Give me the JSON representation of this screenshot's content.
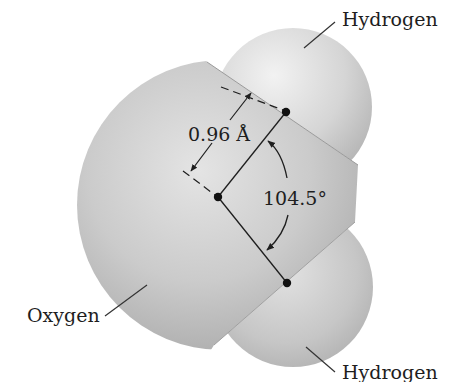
{
  "diagram": {
    "atoms": [
      {
        "id": "hydrogen-top",
        "label": "Hydrogen"
      },
      {
        "id": "oxygen",
        "label": "Oxygen"
      },
      {
        "id": "hydrogen-bottom",
        "label": "Hydrogen"
      }
    ],
    "bond_length": {
      "value": "0.96",
      "unit": "Å",
      "text": "0.96 Å"
    },
    "bond_angle": {
      "value": "104.5",
      "unit": "°",
      "text": "104.5°"
    },
    "colors": {
      "background": "#ffffff",
      "oxygen_fill": "#c4c4c4",
      "hydrogen_fill": "#d6d6d6",
      "lines": "#1e1e1e"
    }
  }
}
